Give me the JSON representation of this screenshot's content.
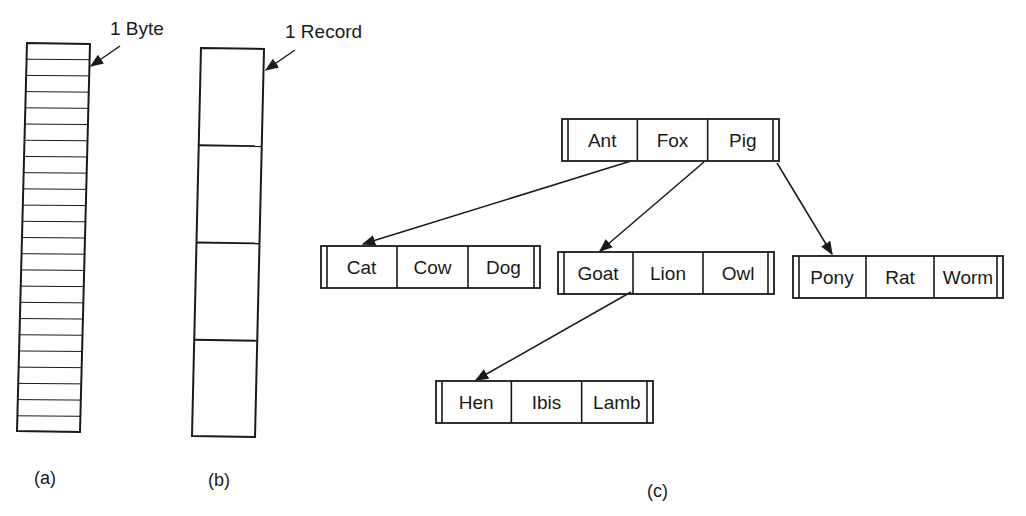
{
  "figure": {
    "a": {
      "caption": "(a)",
      "annotation": "1 Byte",
      "row_count": 24
    },
    "b": {
      "caption": "(b)",
      "annotation": "1 Record",
      "record_count": 4
    },
    "c": {
      "caption": "(c)",
      "nodes": [
        {
          "id": "root",
          "keys": [
            "Ant",
            "Fox",
            "Pig"
          ]
        },
        {
          "id": "n1",
          "keys": [
            "Cat",
            "Cow",
            "Dog"
          ]
        },
        {
          "id": "n2",
          "keys": [
            "Goat",
            "Lion",
            "Owl"
          ]
        },
        {
          "id": "n3",
          "keys": [
            "Pony",
            "Rat",
            "Worm"
          ]
        },
        {
          "id": "n4",
          "keys": [
            "Hen",
            "Ibis",
            "Lamb"
          ]
        }
      ],
      "edges": [
        {
          "from": "root",
          "to": "n1"
        },
        {
          "from": "root",
          "to": "n2"
        },
        {
          "from": "root",
          "to": "n3"
        },
        {
          "from": "n2",
          "to": "n4"
        }
      ]
    }
  }
}
